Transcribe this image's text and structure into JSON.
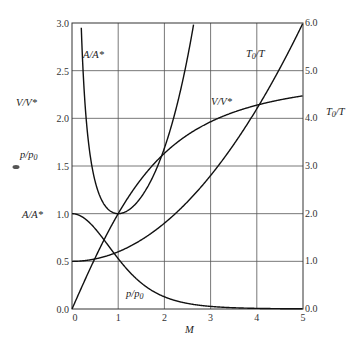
{
  "chart_data": {
    "type": "line",
    "title": "",
    "xlabel": "M",
    "xlim": [
      0,
      5
    ],
    "x_ticks": [
      "0",
      "1",
      "2",
      "3",
      "4",
      "5"
    ],
    "left_axis": {
      "labels": [
        "V/V*",
        "p/p0",
        "A/A*"
      ],
      "ylim": [
        0,
        3.0
      ],
      "ticks": [
        "0.0",
        "0.5",
        "1.0",
        "1.5",
        "2.0",
        "2.5",
        "3.0"
      ]
    },
    "right_axis": {
      "label": "T0/T",
      "ylim": [
        0,
        6.0
      ],
      "ticks": [
        "0.0",
        "1.0",
        "2.0",
        "3.0",
        "4.0",
        "5.0",
        "6.0"
      ]
    },
    "grid": true,
    "x": [
      0,
      0.25,
      0.5,
      0.75,
      1.0,
      1.25,
      1.5,
      1.75,
      2.0,
      2.5,
      3.0,
      3.5,
      4.0,
      4.5,
      5.0
    ],
    "series": [
      {
        "name": "A/A*",
        "axis": "left",
        "values": [
          null,
          2.4,
          1.34,
          1.06,
          1.0,
          1.05,
          1.18,
          1.39,
          1.69,
          2.64,
          4.23,
          6.79,
          10.72,
          16.56,
          25.0
        ]
      },
      {
        "name": "p/p0",
        "axis": "left",
        "values": [
          1.0,
          0.958,
          0.843,
          0.689,
          0.528,
          0.386,
          0.272,
          0.188,
          0.128,
          0.059,
          0.027,
          0.013,
          0.007,
          0.003,
          0.002
        ]
      },
      {
        "name": "V/V*",
        "axis": "left",
        "values": [
          0.0,
          0.271,
          0.535,
          0.779,
          1.0,
          1.195,
          1.365,
          1.511,
          1.633,
          1.826,
          1.964,
          2.064,
          2.138,
          2.194,
          2.236
        ]
      },
      {
        "name": "T0/T",
        "axis": "right",
        "values": [
          1.0,
          1.0125,
          1.05,
          1.1125,
          1.2,
          1.3125,
          1.45,
          1.6125,
          1.8,
          2.25,
          2.8,
          3.45,
          4.2,
          5.05,
          6.0
        ]
      }
    ],
    "annotations": [
      "A/A*",
      "T0/T",
      "V/V*",
      "p/p0"
    ]
  },
  "labels": {
    "left_vv": "V/V*",
    "left_pp": "p/p",
    "left_pp_sub": "0",
    "left_aa": "A/A*",
    "right_t0": "T",
    "right_t0_sub": "0",
    "right_t0_tail": "/T",
    "xlabel": "M",
    "in_aa": "A/A*",
    "in_t0": "T",
    "in_t0_sub": "0",
    "in_t0_tail": "/T",
    "in_vv": "V/V*",
    "in_pp": "p/p",
    "in_pp_sub": "0"
  },
  "left_ticks": [
    "0.0",
    "0.5",
    "1.0",
    "1.5",
    "2.0",
    "2.5",
    "3.0"
  ],
  "right_ticks": [
    "0.0",
    "1.0",
    "2.0",
    "3.0",
    "4.0",
    "5.0",
    "6.0"
  ],
  "x_ticks": [
    "0",
    "1",
    "2",
    "3",
    "4",
    "5"
  ]
}
